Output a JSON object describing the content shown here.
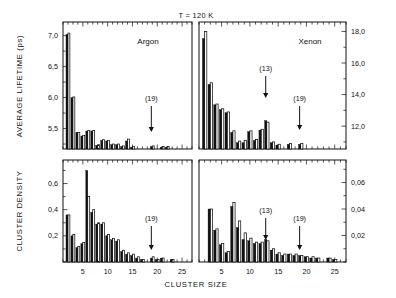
{
  "figure": {
    "condition_label": "T = 120 K",
    "xlabel": "CLUSTER  SIZE",
    "ylabel_top": "AVERAGE  LIFETIME  (ps)",
    "ylabel_bottom": "CLUSTER  DENSITY"
  },
  "chart_data": [
    {
      "type": "bar",
      "panel": "top-left",
      "title": "Argon",
      "subtitle": "T = 120 K",
      "xlabel": "CLUSTER  SIZE",
      "ylabel": "AVERAGE  LIFETIME  (ps)",
      "xlim": [
        1,
        27
      ],
      "ylim": [
        5.17,
        7.22
      ],
      "xticks": [
        5,
        10,
        15,
        20,
        25
      ],
      "yticks": [
        5.5,
        6.0,
        6.5,
        7.0
      ],
      "ytick_labels": [
        "5,5",
        "6,0",
        "6,5",
        "7,0"
      ],
      "grid": false,
      "annotations": [
        {
          "label": "(19)",
          "x": 19
        }
      ],
      "series": [
        {
          "name": "filled",
          "x": [
            2,
            3,
            4,
            5,
            6,
            7,
            8,
            9,
            10,
            11,
            12,
            13,
            14,
            15,
            19,
            21,
            22
          ],
          "values": [
            7.02,
            6.0,
            5.44,
            5.38,
            5.46,
            5.46,
            5.23,
            5.31,
            5.3,
            5.24,
            5.24,
            5.21,
            5.3,
            5.2,
            5.21,
            5.2,
            5.2
          ]
        },
        {
          "name": "open",
          "x": [
            2,
            3,
            4,
            5,
            6,
            7,
            8,
            9,
            10,
            11,
            12,
            13,
            14,
            15,
            19,
            21,
            22
          ],
          "values": [
            7.04,
            6.01,
            5.44,
            5.39,
            5.47,
            5.47,
            5.24,
            5.32,
            5.31,
            5.25,
            5.25,
            5.22,
            5.33,
            5.21,
            5.22,
            5.21,
            5.21
          ]
        }
      ]
    },
    {
      "type": "bar",
      "panel": "top-right",
      "title": "Xenon",
      "subtitle": "T = 120 K",
      "xlabel": "CLUSTER  SIZE",
      "ylabel": "AVERAGE  LIFETIME  (ps)",
      "xlim": [
        1,
        27
      ],
      "ylim": [
        10.55,
        18.6
      ],
      "xticks": [
        5,
        10,
        15,
        20,
        25
      ],
      "yticks": [
        12.0,
        14.0,
        16.0,
        18.0
      ],
      "ytick_labels": [
        "12,0",
        "14,0",
        "16,0",
        "18,0"
      ],
      "grid": false,
      "annotations": [
        {
          "label": "(13)",
          "x": 13
        },
        {
          "label": "(19)",
          "x": 19
        }
      ],
      "series": [
        {
          "name": "filled",
          "x": [
            2,
            3,
            4,
            5,
            6,
            7,
            8,
            9,
            10,
            11,
            12,
            13,
            14,
            15,
            17,
            19
          ],
          "values": [
            17.55,
            14.65,
            13.35,
            13.05,
            12.85,
            11.6,
            10.95,
            10.95,
            11.65,
            11.1,
            11.75,
            12.35,
            10.95,
            10.8,
            10.85,
            10.85
          ]
        },
        {
          "name": "open",
          "x": [
            2,
            3,
            4,
            5,
            6,
            7,
            8,
            9,
            10,
            11,
            12,
            13,
            14,
            15,
            17,
            19
          ],
          "values": [
            18.0,
            14.75,
            13.4,
            13.1,
            12.9,
            11.7,
            11.05,
            11.1,
            11.7,
            11.15,
            11.8,
            12.25,
            11.0,
            10.85,
            10.9,
            10.9
          ]
        }
      ]
    },
    {
      "type": "bar",
      "panel": "bottom-left",
      "title": "Argon",
      "xlabel": "CLUSTER  SIZE",
      "ylabel": "CLUSTER  DENSITY",
      "xlim": [
        1,
        27
      ],
      "ylim": [
        0.0,
        0.78
      ],
      "xticks": [
        5,
        10,
        15,
        20,
        25
      ],
      "yticks": [
        0.2,
        0.4,
        0.6
      ],
      "ytick_labels": [
        "0,2",
        "0,4",
        "0,6"
      ],
      "grid": false,
      "annotations": [
        {
          "label": "(19)",
          "x": 19
        }
      ],
      "series": [
        {
          "name": "filled",
          "x": [
            2,
            3,
            4,
            5,
            6,
            7,
            8,
            9,
            10,
            11,
            12,
            13,
            14,
            15,
            16,
            17,
            19,
            20,
            21,
            23
          ],
          "values": [
            0.36,
            0.2,
            0.11,
            0.14,
            0.7,
            0.38,
            0.29,
            0.29,
            0.2,
            0.17,
            0.16,
            0.08,
            0.06,
            0.05,
            0.03,
            0.02,
            0.03,
            0.02,
            0.03,
            0.02
          ]
        },
        {
          "name": "open",
          "x": [
            2,
            3,
            4,
            5,
            6,
            7,
            8,
            9,
            10,
            11,
            12,
            13,
            14,
            15,
            16,
            17,
            19,
            20,
            21,
            23
          ],
          "values": [
            0.36,
            0.21,
            0.12,
            0.15,
            0.5,
            0.4,
            0.3,
            0.3,
            0.21,
            0.18,
            0.17,
            0.09,
            0.07,
            0.06,
            0.04,
            0.02,
            0.04,
            0.02,
            0.03,
            0.02
          ]
        }
      ]
    },
    {
      "type": "bar",
      "panel": "bottom-right",
      "title": "Xenon",
      "xlabel": "CLUSTER  SIZE",
      "ylabel": "CLUSTER  DENSITY",
      "xlim": [
        1,
        27
      ],
      "ylim": [
        0.0,
        0.077
      ],
      "xticks": [
        5,
        10,
        15,
        20,
        25
      ],
      "yticks": [
        0.02,
        0.04,
        0.06
      ],
      "ytick_labels": [
        "0,02",
        "0,04",
        "0,06"
      ],
      "grid": false,
      "annotations": [
        {
          "label": "(13)",
          "x": 13
        },
        {
          "label": "(19)",
          "x": 19
        }
      ],
      "series": [
        {
          "name": "filled",
          "x": [
            3,
            4,
            5,
            6,
            7,
            8,
            9,
            10,
            11,
            12,
            13,
            14,
            15,
            16,
            17,
            18,
            19,
            20,
            21,
            22,
            24,
            25
          ],
          "values": [
            0.04,
            0.024,
            0.013,
            0.007,
            0.042,
            0.026,
            0.017,
            0.016,
            0.014,
            0.014,
            0.017,
            0.009,
            0.006,
            0.005,
            0.006,
            0.005,
            0.005,
            0.004,
            0.003,
            0.003,
            0.003,
            0.002
          ]
        },
        {
          "name": "open",
          "x": [
            3,
            4,
            5,
            6,
            7,
            8,
            9,
            10,
            11,
            12,
            13,
            14,
            15,
            16,
            17,
            18,
            19,
            20,
            21,
            22,
            24,
            25
          ],
          "values": [
            0.04,
            0.025,
            0.014,
            0.008,
            0.045,
            0.031,
            0.022,
            0.018,
            0.015,
            0.015,
            0.016,
            0.01,
            0.007,
            0.006,
            0.006,
            0.006,
            0.005,
            0.004,
            0.004,
            0.003,
            0.003,
            0.002
          ]
        }
      ]
    }
  ]
}
